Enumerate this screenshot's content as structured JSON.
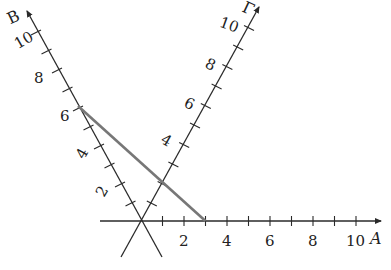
{
  "diagram": {
    "type": "oblique-axes",
    "axes": [
      {
        "name": "A",
        "label": "A",
        "tick_labels": [
          "2",
          "4",
          "6",
          "8",
          "10"
        ]
      },
      {
        "name": "B",
        "label": "B",
        "tick_labels": [
          "2",
          "4",
          "6",
          "8",
          "10"
        ]
      },
      {
        "name": "Gamma",
        "label": "Γ",
        "tick_labels": [
          "4",
          "6",
          "8",
          "10"
        ]
      }
    ],
    "segment": {
      "from": "B = 6",
      "to": "A = 3",
      "color": "#777777"
    },
    "colors": {
      "axis": "#2a2a2a",
      "segment": "#777777"
    }
  },
  "labels": {
    "a_axis": "A",
    "b_axis": "B",
    "g_axis": "Γ",
    "a2": "2",
    "a4": "4",
    "a6": "6",
    "a8": "8",
    "a10": "10",
    "b2": "2",
    "b4": "4",
    "b6": "6",
    "b8": "8",
    "b10": "10",
    "g4": "4",
    "g6": "6",
    "g8": "8",
    "g10": "10"
  }
}
